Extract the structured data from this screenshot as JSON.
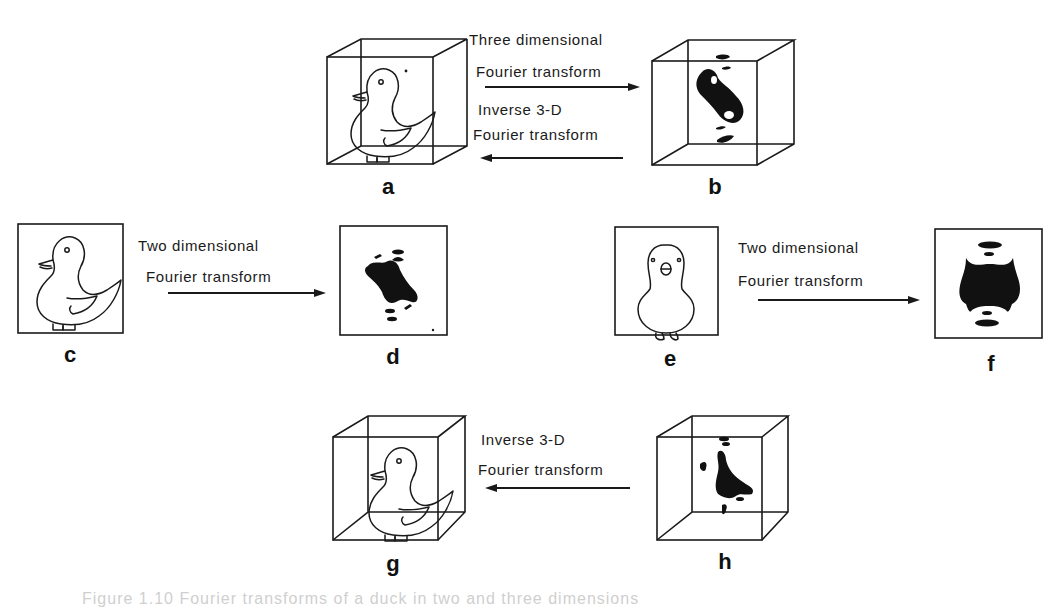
{
  "figure": {
    "panels": {
      "a": {
        "label": "a",
        "description": "3-D cube containing duck outline (side view)"
      },
      "b": {
        "label": "b",
        "description": "3-D cube containing Fourier transform blob"
      },
      "c": {
        "label": "c",
        "description": "2-D box with duck outline (side view)"
      },
      "d": {
        "label": "d",
        "description": "2-D box with Fourier transform of side-view duck"
      },
      "e": {
        "label": "e",
        "description": "2-D box with duck outline (front view)"
      },
      "f": {
        "label": "f",
        "description": "2-D box with Fourier transform of front-view duck"
      },
      "g": {
        "label": "g",
        "description": "3-D cube with reconstructed duck"
      },
      "h": {
        "label": "h",
        "description": "3-D cube with combined transform data"
      }
    },
    "transforms": {
      "top_forward": {
        "line1": "Three dimensional",
        "line2": "Fourier transform",
        "direction": "right"
      },
      "top_inverse": {
        "line1": "Inverse 3-D",
        "line2": "Fourier transform",
        "direction": "left"
      },
      "mid_left": {
        "line1": "Two dimensional",
        "line2": "Fourier transform",
        "direction": "right"
      },
      "mid_right": {
        "line1": "Two  dimensional",
        "line2": "Fourier transform",
        "direction": "right"
      },
      "bottom_inverse": {
        "line1": "Inverse  3-D",
        "line2": "Fourier transform",
        "direction": "left"
      }
    },
    "caption": "Figure 1.10   Fourier transforms of a duck in two and three dimensions"
  },
  "colors": {
    "ink": "#1a1a1a",
    "background": "#ffffff"
  }
}
